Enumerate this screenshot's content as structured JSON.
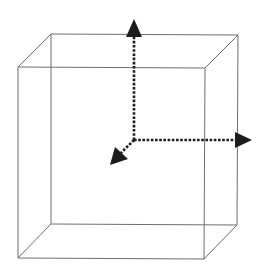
{
  "diagram": {
    "type": "wireframe-cube-with-axes",
    "colors": {
      "background": "#ffffff",
      "cube_edges": "#6e6e6e",
      "axes": "#1c1c1c"
    },
    "cube": {
      "back_face": {
        "top_left": [
          51,
          34
        ],
        "top_right": [
          238,
          35
        ],
        "bottom_right": [
          237,
          225
        ],
        "bottom_left": [
          51,
          224
        ]
      },
      "front_face": {
        "top_left": [
          18,
          67
        ],
        "top_right": [
          205,
          68
        ],
        "bottom_right": [
          204,
          259
        ],
        "bottom_left": [
          18,
          258
        ]
      }
    },
    "axes": {
      "origin": [
        134,
        140
      ],
      "items": [
        {
          "name": "vertical-axis",
          "direction": "up",
          "tip": [
            134,
            20
          ]
        },
        {
          "name": "horizontal-axis",
          "direction": "right",
          "tip": [
            251,
            140
          ]
        },
        {
          "name": "depth-axis",
          "direction": "down-left",
          "tip": [
            111,
            164
          ]
        }
      ]
    },
    "labels": []
  }
}
